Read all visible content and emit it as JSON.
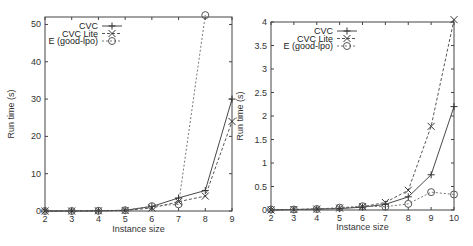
{
  "chart_data": [
    {
      "type": "line",
      "title": "",
      "xlabel": "Instance size",
      "ylabel": "Run time (s)",
      "x": [
        2,
        3,
        4,
        5,
        6,
        7,
        8,
        9
      ],
      "xlim": [
        2,
        9
      ],
      "ylim": [
        0,
        52
      ],
      "xticks": [
        "2",
        "3",
        "4",
        "5",
        "6",
        "7",
        "8",
        "9"
      ],
      "yticks": [
        "0",
        "10",
        "20",
        "30",
        "40",
        "50"
      ],
      "grid": false,
      "legend_position": "top-left inside",
      "series": [
        {
          "name": "CVC",
          "marker": "+",
          "line": "solid",
          "values": [
            0.0,
            0.0,
            0.05,
            0.2,
            1.2,
            3.5,
            5.5,
            30.0
          ]
        },
        {
          "name": "CVC Lite",
          "marker": "x",
          "line": "dashed",
          "values": [
            0.0,
            0.0,
            0.05,
            0.15,
            0.8,
            2.5,
            4.0,
            24.0
          ]
        },
        {
          "name": "E (good-lpo)",
          "marker": "o",
          "line": "dotted",
          "values": [
            0.0,
            0.0,
            0.05,
            0.2,
            1.3,
            1.8,
            52.5,
            null
          ]
        }
      ]
    },
    {
      "type": "line",
      "title": "",
      "xlabel": "Instance size",
      "ylabel": "Run time (s)",
      "x": [
        2,
        3,
        4,
        5,
        6,
        7,
        8,
        9,
        10
      ],
      "xlim": [
        2,
        10
      ],
      "ylim": [
        0,
        4
      ],
      "xticks": [
        "2",
        "3",
        "4",
        "5",
        "6",
        "7",
        "8",
        "9",
        "10"
      ],
      "yticks": [
        "0",
        "0.5",
        "1",
        "1.5",
        "2",
        "2.5",
        "3",
        "3.5",
        "4"
      ],
      "grid": false,
      "legend_position": "top-left inside",
      "series": [
        {
          "name": "CVC",
          "marker": "+",
          "line": "solid",
          "values": [
            0.0,
            0.01,
            0.02,
            0.03,
            0.06,
            0.12,
            0.28,
            0.75,
            2.2
          ]
        },
        {
          "name": "CVC Lite",
          "marker": "x",
          "line": "dashed",
          "values": [
            0.0,
            0.01,
            0.02,
            0.04,
            0.07,
            0.16,
            0.42,
            1.78,
            4.05
          ]
        },
        {
          "name": "E (good-lpo)",
          "marker": "o",
          "line": "dotted",
          "values": [
            0.01,
            0.01,
            0.02,
            0.05,
            0.08,
            0.07,
            0.13,
            0.38,
            0.33
          ]
        }
      ]
    }
  ]
}
